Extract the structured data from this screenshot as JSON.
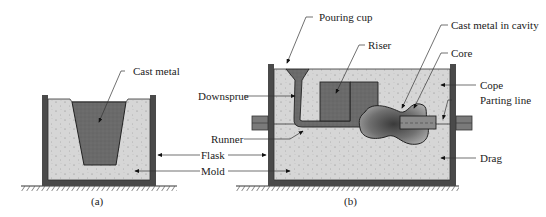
{
  "figure": {
    "panels": [
      {
        "id": "a",
        "caption": "(a)"
      },
      {
        "id": "b",
        "caption": "(b)"
      }
    ],
    "labels": {
      "cast_metal": "Cast metal",
      "flask": "Flask",
      "mold": "Mold",
      "pouring_cup": "Pouring cup",
      "riser": "Riser",
      "downsprue": "Downsprue",
      "runner": "Runner",
      "cast_metal_in_cavity": "Cast metal in cavity",
      "core": "Core",
      "cope": "Cope",
      "parting_line": "Parting line",
      "drag": "Drag"
    },
    "colors": {
      "sand": "#d4d4d4",
      "metal": "#6e6e6e",
      "flask": "#4a4a4a",
      "core": "#8a8a8a",
      "ground_hatch": "#555555"
    }
  }
}
